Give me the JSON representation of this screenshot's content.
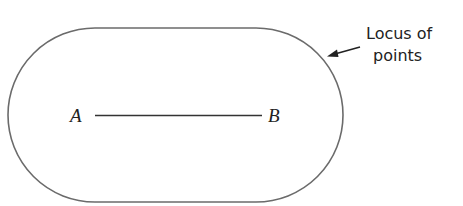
{
  "diagram": {
    "point_a": "A",
    "point_b": "B",
    "annotation_line1": "Locus of",
    "annotation_line2": "points",
    "colors": {
      "stroke": "#6b6b6b",
      "segment": "#333333",
      "text": "#222222"
    }
  }
}
